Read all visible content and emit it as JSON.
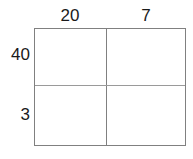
{
  "diagram": {
    "kind": "area-model-multiplication-grid",
    "colors": {
      "border": "#808080",
      "divider": "#9a9a9a",
      "text": "#1a1a1a",
      "background": "#ffffff"
    },
    "column_labels": [
      "20",
      "7"
    ],
    "row_labels": [
      "40",
      "3"
    ],
    "cells": [
      [
        "",
        ""
      ],
      [
        "",
        ""
      ]
    ]
  }
}
